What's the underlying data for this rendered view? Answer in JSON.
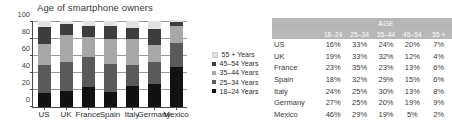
{
  "chart_data": {
    "type": "bar",
    "subtype": "stacked-column",
    "title": "Age of smartphone owners",
    "xlabel": "",
    "ylabel": "",
    "ylim": [
      0,
      100
    ],
    "yticks": [
      0,
      20,
      40,
      60,
      80,
      100
    ],
    "grid": true,
    "legend_position": "right",
    "categories": [
      "US",
      "UK",
      "France",
      "Spain",
      "Italy",
      "Germany",
      "Mexico"
    ],
    "series": [
      {
        "name": "18–24 Years",
        "color": "#121212",
        "values": [
          16,
          19,
          23,
          18,
          24,
          27,
          46
        ]
      },
      {
        "name": "25–34 Years",
        "color": "#5a5a5a",
        "values": [
          33,
          33,
          35,
          32,
          25,
          25,
          29
        ]
      },
      {
        "name": "35–44 Years",
        "color": "#a8a8a8",
        "values": [
          24,
          32,
          23,
          29,
          30,
          20,
          19
        ]
      },
      {
        "name": "45–54 Years",
        "color": "#3d3d3d",
        "values": [
          20,
          12,
          13,
          15,
          13,
          19,
          5
        ]
      },
      {
        "name": "55 + Years",
        "color": "#e2e2e2",
        "values": [
          7,
          4,
          6,
          6,
          8,
          9,
          2
        ]
      }
    ],
    "legend_order_top_to_bottom": [
      "55 + Years",
      "45–54 Years",
      "35–44 Years",
      "25–34 Years",
      "18–24 Years"
    ]
  },
  "legend": {
    "items": [
      {
        "label": "55 + Years",
        "color": "#e2e2e2"
      },
      {
        "label": "45–54 Years",
        "color": "#3d3d3d"
      },
      {
        "label": "35–44 Years",
        "color": "#a8a8a8"
      },
      {
        "label": "25–34 Years",
        "color": "#5a5a5a"
      },
      {
        "label": "18–24 Years",
        "color": "#121212"
      }
    ]
  },
  "table": {
    "group_header": "AGE",
    "header_bg": "#b6b6b6",
    "header_text_color": "#ffffff",
    "columns": [
      "18–24",
      "25–34",
      "35–44",
      "45–54",
      "55 +"
    ],
    "rows": [
      {
        "label": "US",
        "values": [
          "16%",
          "33%",
          "24%",
          "20%",
          "7%"
        ]
      },
      {
        "label": "UK",
        "values": [
          "19%",
          "33%",
          "32%",
          "12%",
          "4%"
        ]
      },
      {
        "label": "France",
        "values": [
          "23%",
          "35%",
          "23%",
          "13%",
          "6%"
        ]
      },
      {
        "label": "Spain",
        "values": [
          "18%",
          "32%",
          "29%",
          "15%",
          "6%"
        ]
      },
      {
        "label": "Italy",
        "values": [
          "24%",
          "25%",
          "30%",
          "13%",
          "8%"
        ]
      },
      {
        "label": "Germany",
        "values": [
          "27%",
          "25%",
          "20%",
          "19%",
          "9%"
        ]
      },
      {
        "label": "Mexico",
        "values": [
          "46%",
          "29%",
          "19%",
          "5%",
          "2%"
        ]
      }
    ]
  }
}
